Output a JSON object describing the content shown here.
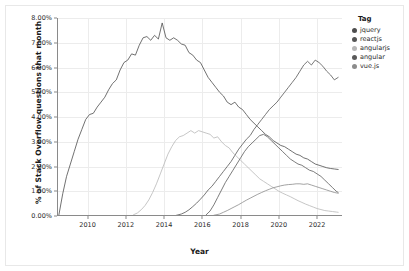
{
  "chart_data": {
    "type": "line",
    "title": "",
    "xlabel": "Year",
    "ylabel": "% of Stack Overflow questions that month",
    "xlim": [
      2008.4,
      2023.3
    ],
    "ylim": [
      0,
      8
    ],
    "grid": true,
    "legend_position": "right",
    "legend_title": "Tag",
    "y_tick_labels": [
      "0.00%",
      "1.00%",
      "2.00%",
      "3.00%",
      "4.00%",
      "5.00%",
      "6.00%",
      "7.00%",
      "8.00%"
    ],
    "y_tick_values": [
      0,
      1,
      2,
      3,
      4,
      5,
      6,
      7,
      8
    ],
    "x_tick_labels": [
      "2010",
      "2012",
      "2014",
      "2016",
      "2018",
      "2020",
      "2022"
    ],
    "x_tick_values": [
      2010,
      2012,
      2014,
      2016,
      2018,
      2020,
      2022
    ],
    "series": [
      {
        "name": "jquery",
        "color": "#4d4d4d",
        "x": [
          2008.5,
          2008.7,
          2008.9,
          2009.1,
          2009.3,
          2009.5,
          2009.7,
          2009.9,
          2010.1,
          2010.3,
          2010.5,
          2010.7,
          2010.9,
          2011.1,
          2011.3,
          2011.5,
          2011.7,
          2011.9,
          2012.1,
          2012.3,
          2012.5,
          2012.7,
          2012.9,
          2013.1,
          2013.3,
          2013.5,
          2013.7,
          2013.9,
          2014.1,
          2014.3,
          2014.5,
          2014.7,
          2014.9,
          2015.1,
          2015.3,
          2015.5,
          2015.7,
          2015.9,
          2016.1,
          2016.3,
          2016.5,
          2016.7,
          2016.9,
          2017.1,
          2017.3,
          2017.5,
          2017.7,
          2017.9,
          2018.1,
          2018.3,
          2018.5,
          2018.7,
          2018.9,
          2019.1,
          2019.3,
          2019.5,
          2019.7,
          2019.9,
          2020.1,
          2020.3,
          2020.5,
          2020.7,
          2020.9,
          2021.1,
          2021.3,
          2021.5,
          2021.7,
          2021.9,
          2022.1,
          2022.3,
          2022.5,
          2022.7,
          2022.9,
          2023.1
        ],
        "values": [
          0.05,
          0.9,
          1.6,
          2.1,
          2.6,
          3.1,
          3.5,
          3.9,
          4.1,
          4.15,
          4.4,
          4.6,
          4.8,
          5.1,
          5.35,
          5.5,
          5.9,
          6.2,
          6.3,
          6.55,
          6.5,
          6.9,
          7.2,
          7.25,
          7.1,
          7.3,
          7.15,
          7.8,
          7.2,
          7.1,
          7.2,
          7.1,
          6.95,
          6.9,
          6.6,
          6.5,
          6.3,
          6.2,
          5.9,
          5.6,
          5.4,
          5.2,
          5.0,
          4.85,
          4.6,
          4.5,
          4.6,
          4.4,
          4.3,
          4.1,
          3.9,
          3.75,
          3.6,
          3.45,
          3.3,
          3.2,
          3.05,
          2.95,
          2.85,
          2.8,
          2.7,
          2.6,
          2.5,
          2.45,
          2.35,
          2.3,
          2.2,
          2.1,
          2.05,
          2.0,
          1.95,
          1.92,
          1.9,
          1.88
        ]
      },
      {
        "name": "reactjs",
        "color": "#555555",
        "x": [
          2014.6,
          2014.9,
          2015.1,
          2015.3,
          2015.5,
          2015.7,
          2015.9,
          2016.1,
          2016.3,
          2016.5,
          2016.7,
          2016.9,
          2017.1,
          2017.3,
          2017.5,
          2017.7,
          2017.9,
          2018.1,
          2018.3,
          2018.5,
          2018.7,
          2018.9,
          2019.1,
          2019.3,
          2019.5,
          2019.7,
          2019.9,
          2020.1,
          2020.3,
          2020.5,
          2020.7,
          2020.9,
          2021.1,
          2021.3,
          2021.5,
          2021.7,
          2021.9,
          2022.1,
          2022.3,
          2022.5,
          2022.7,
          2022.9,
          2023.1
        ],
        "values": [
          0.02,
          0.08,
          0.15,
          0.25,
          0.38,
          0.52,
          0.68,
          0.85,
          1.05,
          1.2,
          1.4,
          1.6,
          1.8,
          2.0,
          2.2,
          2.45,
          2.7,
          2.9,
          3.1,
          3.25,
          3.5,
          3.7,
          3.9,
          4.1,
          4.3,
          4.45,
          4.6,
          4.8,
          5.0,
          5.2,
          5.4,
          5.6,
          5.85,
          6.1,
          6.25,
          6.1,
          6.3,
          6.2,
          6.05,
          5.85,
          5.7,
          5.5,
          5.6
        ]
      },
      {
        "name": "angularjs",
        "color": "#b8b8b8",
        "x": [
          2012.4,
          2012.6,
          2012.8,
          2013.0,
          2013.2,
          2013.4,
          2013.6,
          2013.8,
          2014.0,
          2014.2,
          2014.4,
          2014.6,
          2014.8,
          2015.0,
          2015.2,
          2015.4,
          2015.6,
          2015.8,
          2016.0,
          2016.2,
          2016.4,
          2016.6,
          2016.8,
          2017.0,
          2017.2,
          2017.4,
          2017.6,
          2017.8,
          2018.0,
          2018.2,
          2018.4,
          2018.6,
          2018.8,
          2019.0,
          2019.2,
          2019.4,
          2019.6,
          2019.8,
          2020.0,
          2020.2,
          2020.4,
          2020.6,
          2020.8,
          2021.0,
          2021.2,
          2021.4,
          2021.6,
          2021.8,
          2022.0,
          2022.2,
          2022.4,
          2022.6,
          2022.8,
          2023.0,
          2023.1
        ],
        "values": [
          0.05,
          0.12,
          0.25,
          0.42,
          0.65,
          0.95,
          1.3,
          1.7,
          2.1,
          2.5,
          2.8,
          3.05,
          3.2,
          3.25,
          3.35,
          3.45,
          3.35,
          3.45,
          3.4,
          3.35,
          3.3,
          3.15,
          3.2,
          3.0,
          2.85,
          2.75,
          2.55,
          2.4,
          2.25,
          2.1,
          1.95,
          1.8,
          1.65,
          1.5,
          1.4,
          1.3,
          1.2,
          1.1,
          1.0,
          0.92,
          0.85,
          0.78,
          0.7,
          0.62,
          0.55,
          0.48,
          0.42,
          0.36,
          0.3,
          0.26,
          0.22,
          0.2,
          0.18,
          0.16,
          0.15
        ]
      },
      {
        "name": "angular",
        "color": "#5a5a5a",
        "x": [
          2016.2,
          2016.4,
          2016.6,
          2016.8,
          2017.0,
          2017.2,
          2017.4,
          2017.6,
          2017.8,
          2018.0,
          2018.2,
          2018.4,
          2018.6,
          2018.8,
          2019.0,
          2019.2,
          2019.4,
          2019.6,
          2019.8,
          2020.0,
          2020.2,
          2020.4,
          2020.6,
          2020.8,
          2021.0,
          2021.2,
          2021.4,
          2021.6,
          2021.8,
          2022.0,
          2022.2,
          2022.4,
          2022.6,
          2022.8,
          2023.0,
          2023.1
        ],
        "values": [
          0.05,
          0.2,
          0.45,
          0.75,
          1.05,
          1.35,
          1.6,
          1.85,
          2.1,
          2.35,
          2.6,
          2.8,
          2.95,
          3.1,
          3.25,
          3.3,
          3.2,
          3.05,
          2.9,
          2.75,
          2.6,
          2.45,
          2.3,
          2.2,
          2.1,
          2.05,
          1.95,
          1.85,
          1.8,
          1.7,
          1.6,
          1.45,
          1.3,
          1.15,
          1.0,
          0.95
        ]
      },
      {
        "name": "vue.js",
        "color": "#8c8c8c",
        "x": [
          2016.6,
          2016.9,
          2017.1,
          2017.3,
          2017.5,
          2017.7,
          2017.9,
          2018.1,
          2018.3,
          2018.5,
          2018.7,
          2018.9,
          2019.1,
          2019.3,
          2019.5,
          2019.7,
          2019.9,
          2020.1,
          2020.3,
          2020.5,
          2020.7,
          2020.9,
          2021.1,
          2021.3,
          2021.5,
          2021.7,
          2021.9,
          2022.1,
          2022.3,
          2022.5,
          2022.7,
          2022.9,
          2023.1
        ],
        "values": [
          0.03,
          0.08,
          0.15,
          0.22,
          0.3,
          0.38,
          0.46,
          0.55,
          0.64,
          0.72,
          0.8,
          0.88,
          0.95,
          1.02,
          1.08,
          1.14,
          1.18,
          1.22,
          1.25,
          1.27,
          1.28,
          1.3,
          1.3,
          1.28,
          1.3,
          1.25,
          1.2,
          1.15,
          1.1,
          1.05,
          1.0,
          0.95,
          0.92
        ]
      }
    ]
  },
  "legend": {
    "title": "Tag",
    "items": [
      {
        "label": "jquery",
        "color": "#4d4d4d"
      },
      {
        "label": "reactjs",
        "color": "#555555"
      },
      {
        "label": "angularjs",
        "color": "#b8b8b8"
      },
      {
        "label": "angular",
        "color": "#5a5a5a"
      },
      {
        "label": "vue.js",
        "color": "#8c8c8c"
      }
    ]
  }
}
